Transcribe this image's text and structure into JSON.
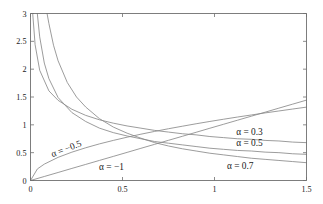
{
  "chart_data": {
    "type": "line",
    "title": "",
    "xlabel": "",
    "ylabel": "",
    "xlim": [
      0,
      1.5
    ],
    "ylim": [
      0,
      3
    ],
    "grid": false,
    "legend": "inline-annotations",
    "xticks": [
      "0",
      "0.5",
      "1",
      "1.5"
    ],
    "xtick_values": [
      0,
      0.5,
      1,
      1.5
    ],
    "yticks": [
      "0",
      "0.5",
      "1",
      "1.5",
      "2",
      "2.5",
      "3"
    ],
    "ytick_values": [
      0,
      0.5,
      1,
      1.5,
      2,
      2.5,
      3
    ],
    "series": [
      {
        "name": "α = −1",
        "alpha": -1,
        "label": "α = −1",
        "x": [
          0,
          0.075,
          0.15,
          0.225,
          0.3,
          0.375,
          0.45,
          0.525,
          0.6,
          0.675,
          0.75,
          0.825,
          0.9,
          0.975,
          1.05,
          1.125,
          1.2,
          1.275,
          1.35,
          1.425,
          1.5
        ],
        "values": [
          0,
          0.072,
          0.144,
          0.217,
          0.289,
          0.361,
          0.433,
          0.505,
          0.578,
          0.65,
          0.722,
          0.794,
          0.866,
          0.939,
          1.011,
          1.083,
          1.155,
          1.227,
          1.3,
          1.372,
          1.444
        ]
      },
      {
        "name": "α = −0.5",
        "alpha": -0.5,
        "label": "α = −0.5",
        "x": [
          0,
          0.0375,
          0.075,
          0.15,
          0.225,
          0.3,
          0.375,
          0.45,
          0.525,
          0.6,
          0.675,
          0.75,
          0.825,
          0.9,
          0.975,
          1.05,
          1.125,
          1.2,
          1.275,
          1.35,
          1.425,
          1.5
        ],
        "values": [
          0,
          0.208,
          0.294,
          0.416,
          0.509,
          0.588,
          0.658,
          0.72,
          0.778,
          0.832,
          0.882,
          0.93,
          0.975,
          1.019,
          1.061,
          1.101,
          1.14,
          1.177,
          1.214,
          1.249,
          1.284,
          1.318
        ]
      },
      {
        "name": "α = 0.3",
        "alpha": 0.3,
        "label": "α = 0.3",
        "x": [
          0.012,
          0.025,
          0.05,
          0.1,
          0.15,
          0.225,
          0.3,
          0.375,
          0.45,
          0.525,
          0.6,
          0.675,
          0.75,
          0.825,
          0.9,
          0.975,
          1.05,
          1.125,
          1.2,
          1.275,
          1.35,
          1.425,
          1.5
        ],
        "values": [
          3.0,
          2.44,
          1.98,
          1.61,
          1.44,
          1.28,
          1.17,
          1.09,
          1.03,
          0.98,
          0.94,
          0.9,
          0.87,
          0.84,
          0.82,
          0.79,
          0.77,
          0.75,
          0.74,
          0.72,
          0.71,
          0.69,
          0.68
        ]
      },
      {
        "name": "α = 0.5",
        "alpha": 0.5,
        "label": "α = 0.5",
        "x": [
          0.037,
          0.05,
          0.075,
          0.1,
          0.15,
          0.225,
          0.3,
          0.375,
          0.45,
          0.525,
          0.6,
          0.675,
          0.75,
          0.825,
          0.9,
          0.975,
          1.05,
          1.125,
          1.2,
          1.275,
          1.35,
          1.425,
          1.5
        ],
        "values": [
          3.0,
          2.58,
          2.11,
          1.83,
          1.49,
          1.22,
          1.06,
          0.94,
          0.86,
          0.8,
          0.75,
          0.7,
          0.67,
          0.64,
          0.61,
          0.58,
          0.56,
          0.54,
          0.53,
          0.51,
          0.5,
          0.48,
          0.47
        ]
      },
      {
        "name": "α = 0.7",
        "alpha": 0.7,
        "label": "α = 0.7",
        "x": [
          0.09,
          0.1,
          0.125,
          0.15,
          0.2,
          0.25,
          0.3,
          0.375,
          0.45,
          0.525,
          0.6,
          0.675,
          0.75,
          0.825,
          0.9,
          0.975,
          1.05,
          1.125,
          1.2,
          1.275,
          1.35,
          1.425,
          1.5
        ],
        "values": [
          3.0,
          2.82,
          2.43,
          2.15,
          1.76,
          1.5,
          1.32,
          1.11,
          0.96,
          0.85,
          0.76,
          0.68,
          0.62,
          0.57,
          0.53,
          0.49,
          0.46,
          0.43,
          0.4,
          0.38,
          0.36,
          0.34,
          0.32
        ]
      }
    ],
    "annotations": [
      {
        "text": "α = −0.5",
        "x": 0.2,
        "y": 0.52,
        "rotation": -21
      },
      {
        "text": "α = −1",
        "x": 0.44,
        "y": 0.18,
        "rotation": 0
      },
      {
        "text": "α = 0.3",
        "x": 1.19,
        "y": 0.82,
        "rotation": 0
      },
      {
        "text": "α = 0.5",
        "x": 1.19,
        "y": 0.62,
        "rotation": 0
      },
      {
        "text": "α = 0.7",
        "x": 1.14,
        "y": 0.2,
        "rotation": 0
      }
    ]
  },
  "colors": {
    "curve": "#8a8a8a",
    "axis": "#6e6e6e",
    "text": "#1a1a1a",
    "background": "#ffffff"
  }
}
